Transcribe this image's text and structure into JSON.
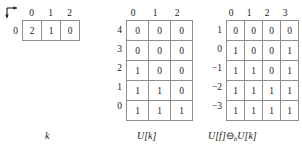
{
  "figure": {
    "axis_marker": {
      "icon": "axes-origin-arrow-icon"
    },
    "tables": [
      {
        "id": "k",
        "caption": "k",
        "col_headers": [
          "0",
          "1",
          "2"
        ],
        "row_labels": [
          "0"
        ],
        "rows": [
          [
            "2",
            "1",
            "0"
          ]
        ]
      },
      {
        "id": "u",
        "caption": "U[k]",
        "col_headers": [
          "0",
          "1",
          "2"
        ],
        "row_labels": [
          "4",
          "3",
          "2",
          "1",
          "0"
        ],
        "rows": [
          [
            "0",
            "0",
            "0"
          ],
          [
            "0",
            "0",
            "0"
          ],
          [
            "1",
            "0",
            "0"
          ],
          [
            "1",
            "1",
            "0"
          ],
          [
            "1",
            "1",
            "1"
          ]
        ]
      },
      {
        "id": "e",
        "caption_parts": {
          "left": "U[f]",
          "op": "⊖",
          "sub": "b",
          "right": "U[k]"
        },
        "caption": "U[f]⊖bU[k]",
        "col_headers": [
          "0",
          "1",
          "2",
          "3"
        ],
        "row_labels": [
          "1",
          "0",
          "−1",
          "−2",
          "−3"
        ],
        "rows": [
          [
            "0",
            "0",
            "0",
            "0"
          ],
          [
            "1",
            "0",
            "0",
            "1"
          ],
          [
            "1",
            "1",
            "0",
            "1"
          ],
          [
            "1",
            "1",
            "1",
            "1"
          ],
          [
            "1",
            "1",
            "1",
            "1"
          ]
        ]
      }
    ],
    "colors": {
      "grid": "#8e8e8e",
      "text": "#1a1a1a",
      "background": "#ffffff"
    }
  }
}
